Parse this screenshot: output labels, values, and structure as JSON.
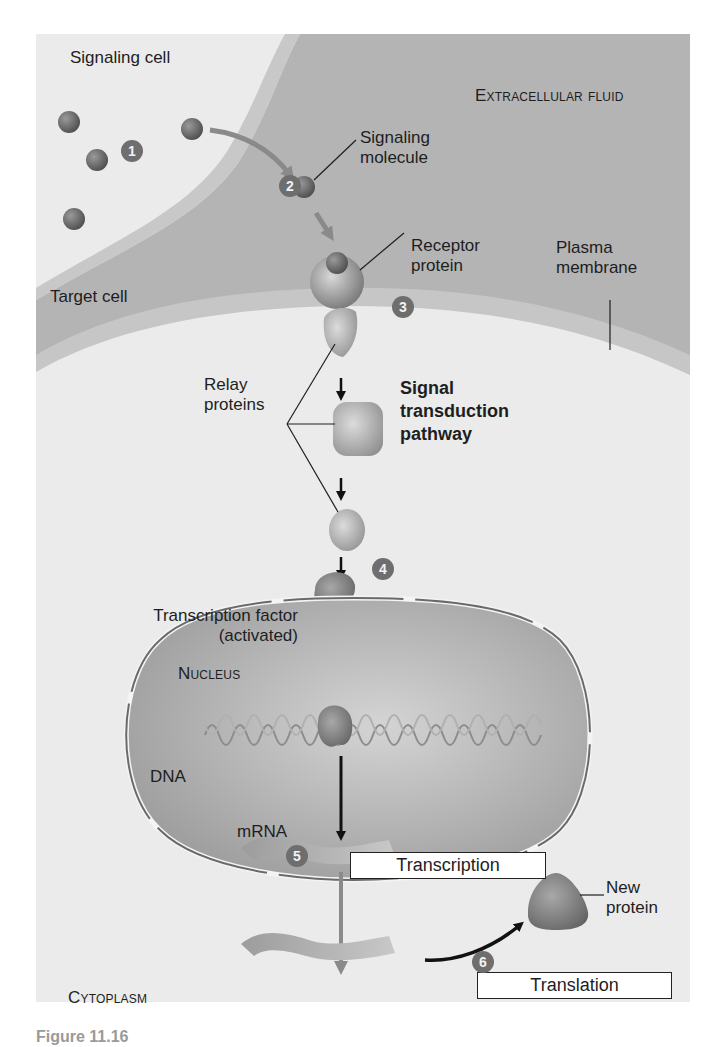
{
  "figure": {
    "regions": {
      "signaling_cell": "Signaling cell",
      "extracellular_fluid": "Extracellular fluid",
      "target_cell": "Target cell",
      "nucleus": "Nucleus",
      "cytoplasm": "Cytoplasm"
    },
    "labels": {
      "signaling_molecule": [
        "Signaling",
        "molecule"
      ],
      "receptor_protein": [
        "Receptor",
        "protein"
      ],
      "plasma_membrane": [
        "Plasma",
        "membrane"
      ],
      "relay_proteins": [
        "Relay",
        "proteins"
      ],
      "pathway": [
        "Signal",
        "transduction",
        "pathway"
      ],
      "transcription_factor": [
        "Transcription factor",
        "(activated)"
      ],
      "dna": "DNA",
      "mrna": "mRNA",
      "new_protein": [
        "New",
        "protein"
      ]
    },
    "process_boxes": {
      "transcription": "Transcription",
      "translation": "Translation"
    },
    "steps": [
      "1",
      "2",
      "3",
      "4",
      "5",
      "6"
    ],
    "caption": "Figure 11.16"
  },
  "colors": {
    "background": "#ebebeb",
    "extracellular": "#b4b4b4",
    "membrane": "#c6c6c6",
    "nucleus": "#a9a9a9",
    "molecule": "#707070",
    "step_badge": "#6e6e6e",
    "arrow_dark": "#111111",
    "arrow_gray": "#8a8a8a"
  }
}
